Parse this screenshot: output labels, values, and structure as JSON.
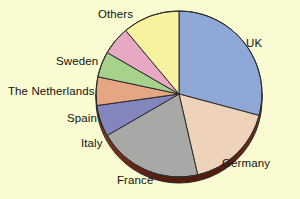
{
  "background_color": "#fbfbd2",
  "chart_data": {
    "type": "pie",
    "title": "",
    "subtitle": "",
    "xlabel": "",
    "ylabel": "",
    "legend_position": "none",
    "labels_position": "outside-callout",
    "grid": false,
    "start_angle_deg": 0,
    "direction": "clockwise",
    "categories": [
      "UK",
      "Germany",
      "France",
      "Italy",
      "Spain",
      "The Netherlands",
      "Sweden",
      "Others"
    ],
    "values": [
      29.2,
      17.2,
      20.3,
      6.1,
      5.6,
      5.0,
      5.6,
      11.0
    ],
    "units": "percent",
    "slices": [
      {
        "label": "UK",
        "value": 29.2,
        "angle_deg": 105,
        "color": "#8fa7d4",
        "edge_color": "#2b2b2b"
      },
      {
        "label": "Germany",
        "value": 17.2,
        "angle_deg": 62,
        "color": "#eed2b9",
        "edge_color": "#2b2b2b"
      },
      {
        "label": "France",
        "value": 20.3,
        "angle_deg": 73,
        "color": "#a8a9a6",
        "edge_color": "#2b2b2b"
      },
      {
        "label": "Italy",
        "value": 6.1,
        "angle_deg": 22,
        "color": "#8386bd",
        "edge_color": "#2b2b2b"
      },
      {
        "label": "Spain",
        "value": 5.6,
        "angle_deg": 20,
        "color": "#e6a583",
        "edge_color": "#2b2b2b"
      },
      {
        "label": "The Netherlands",
        "value": 5.0,
        "angle_deg": 18,
        "color": "#a6d28c",
        "edge_color": "#2b2b2b"
      },
      {
        "label": "Sweden",
        "value": 5.6,
        "angle_deg": 20,
        "color": "#e7a8c4",
        "edge_color": "#2b2b2b"
      },
      {
        "label": "Others",
        "value": 11.0,
        "angle_deg": 40,
        "color": "#f6f2a0",
        "edge_color": "#2b2b2b"
      }
    ],
    "style": {
      "three_d": true,
      "rim_color": "#7b2d19",
      "rim_shadow_color": "#5d1f10",
      "center_x": 179,
      "center_y": 94,
      "radius": 83,
      "depth": 6
    }
  },
  "labels": {
    "uk": "UK",
    "germany": "Germany",
    "france": "France",
    "italy": "Italy",
    "spain": "Spain",
    "netherlands": "The Netherlands",
    "sweden": "Sweden",
    "others": "Others"
  }
}
